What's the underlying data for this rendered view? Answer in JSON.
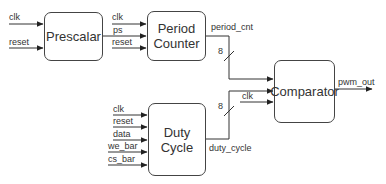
{
  "diagram": {
    "title": "",
    "blocks": [
      {
        "id": "prescalar",
        "label": "Prescalar"
      },
      {
        "id": "period_counter",
        "label_line1": "Period",
        "label_line2": "Counter"
      },
      {
        "id": "comparator",
        "label": "Comparator"
      },
      {
        "id": "duty_cycle",
        "label_line1": "Duty",
        "label_line2": "Cycle"
      }
    ],
    "prescalar_inputs": [
      "clk",
      "reset"
    ],
    "period_counter_inputs": [
      "clk",
      "ps",
      "reset"
    ],
    "duty_cycle_inputs": [
      "clk",
      "reset",
      "data",
      "we_bar",
      "cs_bar"
    ],
    "comparator_inputs": [
      "period_cnt",
      "duty_cycle",
      "clk"
    ],
    "signals": {
      "period_cnt": "period_cnt",
      "duty_cycle": "duty_cycle",
      "pwm_out": "pwm_out",
      "comparator_clk": "clk"
    },
    "bus_widths": {
      "period_cnt": "8",
      "duty_cycle": "8"
    },
    "connections": [
      {
        "from": "input:clk",
        "to": "prescalar"
      },
      {
        "from": "input:reset",
        "to": "prescalar"
      },
      {
        "from": "prescalar",
        "to": "period_counter",
        "signal": "ps"
      },
      {
        "from": "input:clk",
        "to": "period_counter"
      },
      {
        "from": "input:reset",
        "to": "period_counter"
      },
      {
        "from": "period_counter",
        "to": "comparator",
        "signal": "period_cnt",
        "width": 8
      },
      {
        "from": "duty_cycle",
        "to": "comparator",
        "signal": "duty_cycle",
        "width": 8
      },
      {
        "from": "input:clk",
        "to": "comparator"
      },
      {
        "from": "comparator",
        "to": "output:pwm_out"
      }
    ]
  }
}
